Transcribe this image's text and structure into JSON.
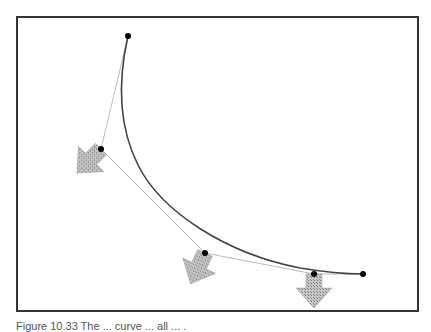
{
  "figure": {
    "frame": {
      "x": 17,
      "y": 17,
      "width": 401,
      "height": 294,
      "stroke": "#333333"
    },
    "control_points": [
      {
        "x": 128,
        "y": 36
      },
      {
        "x": 101,
        "y": 149
      },
      {
        "x": 205,
        "y": 253
      },
      {
        "x": 314,
        "y": 274
      },
      {
        "x": 363,
        "y": 274
      }
    ],
    "control_polygon_color": "#bbbbbb",
    "curve_color": "#444444",
    "curve_path": "M128,36 C118,80 120,120 140,165 C165,215 230,255 300,268 C330,273 350,274 363,274",
    "arrows": [
      {
        "name": "arrow-1",
        "at": {
          "x": 101,
          "y": 149
        },
        "rotation": 45
      },
      {
        "name": "arrow-2",
        "at": {
          "x": 205,
          "y": 253
        },
        "rotation": 20
      },
      {
        "name": "arrow-3",
        "at": {
          "x": 314,
          "y": 274
        },
        "rotation": 0
      }
    ],
    "arrow_fill": "#a8a8a8"
  },
  "caption": "Figure 10.33   The ... curve ... all ... ."
}
